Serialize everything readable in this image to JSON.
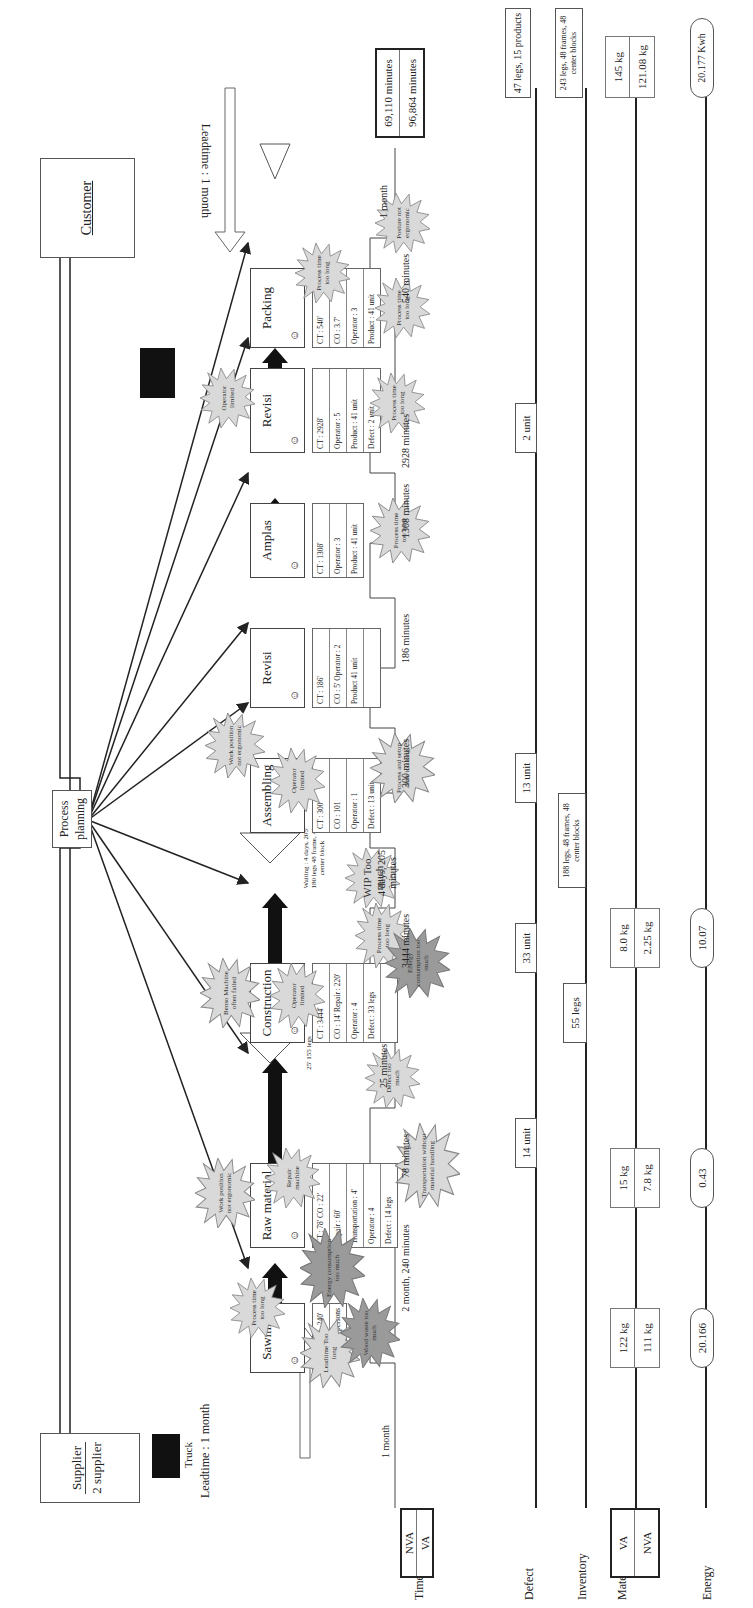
{
  "entities": {
    "supplier": {
      "title": "Supplier",
      "subtitle": "2 supplier"
    },
    "customer": {
      "title": "Customer"
    },
    "process_planning": {
      "label_line1": "Process",
      "label_line2": "planning"
    },
    "supplier_truck": {
      "label": "Truck",
      "leadtime": "Leadtime : 1 month"
    },
    "customer_leadtime": "Leadtime : 1 month"
  },
  "processes": [
    {
      "name": "Sawmill",
      "data": [
        "CT : 2 month, 240'",
        "Operator : 4 persons"
      ]
    },
    {
      "name": "Raw material",
      "data": [
        "CT : 78'  CO : 22'",
        "Repair : 60'",
        "Transportation : 4'",
        "Operator : 4",
        "Defect : 14 legs"
      ]
    },
    {
      "name": "Construction",
      "data": [
        "CT : 3444'",
        "CO : 14'  Repair : 220'",
        "Operator : 4",
        "Defect : 33 legs",
        ""
      ]
    },
    {
      "name": "Assembling",
      "data": [
        "CT : 300",
        "CO : 101",
        "Operator : 1",
        "Defect : 13 unit"
      ]
    },
    {
      "name": "Revisi",
      "data": [
        "CT : 186'",
        "CO : 5'  Operator : 2",
        "Product 41 unit",
        ""
      ]
    },
    {
      "name": "Amplas",
      "data": [
        "CT : 1308'",
        "Operator : 3",
        "Product : 41 unit"
      ]
    },
    {
      "name": "Revisi",
      "data": [
        "CT : 2928'",
        "Operator : 5",
        "Product : 41 unit",
        "Defect : 2 unit"
      ]
    },
    {
      "name": "Packing",
      "data": [
        "CT : 540'",
        "CO : 3.7'",
        "Operator : 3",
        "Product : 41 unit"
      ]
    }
  ],
  "inventory_triangles": [
    {
      "id": "raw-wip",
      "note": "25'  155 legs"
    },
    {
      "id": "construction-wip",
      "note": "Waiting : 4 days, 205'  180 legs  48 frame,  48 center block"
    }
  ],
  "kaizen_bursts": [
    {
      "text": "Leadtime Too long",
      "tone": "light"
    },
    {
      "text": "Process time too long",
      "tone": "light"
    },
    {
      "text": "Energy consumption too much",
      "tone": "dark"
    },
    {
      "text": "Wood waste too much",
      "tone": "dark"
    },
    {
      "text": "Work position not ergonomic",
      "tone": "light"
    },
    {
      "text": "Repair machine",
      "tone": "light"
    },
    {
      "text": "Transportation without material handling",
      "tone": "light"
    },
    {
      "text": "Defect too much",
      "tone": "light"
    },
    {
      "text": "Benso Machine often failed",
      "tone": "light"
    },
    {
      "text": "Operator limited",
      "tone": "light"
    },
    {
      "text": "Process time too long",
      "tone": "light"
    },
    {
      "text": "Energy consumption too much",
      "tone": "dark"
    },
    {
      "text": "WIP Too much",
      "tone": "light"
    },
    {
      "text": "Operator limited",
      "tone": "light"
    },
    {
      "text": "Work position not ergonomic",
      "tone": "light"
    },
    {
      "text": "Process and setup time too long",
      "tone": "light"
    },
    {
      "text": "Process time too long",
      "tone": "light"
    },
    {
      "text": "Operator limited",
      "tone": "light"
    },
    {
      "text": "Process time too long",
      "tone": "light"
    },
    {
      "text": "Process time too long",
      "tone": "light"
    },
    {
      "text": "Process time too long",
      "tone": "light"
    },
    {
      "text": "Posture not ergonomic",
      "tone": "light"
    }
  ],
  "timeline": {
    "row_labels": {
      "time": "Time",
      "defect": "Defect",
      "inventory": "Inventory",
      "material": "Material",
      "energy": "Energy"
    },
    "legend_time": {
      "top": "NVA",
      "bottom": "VA"
    },
    "legend_material": {
      "top": "VA",
      "bottom": "NVA"
    },
    "time_segments": [
      "1 month",
      "2 month, 240 minutes",
      "78 minutes",
      "25 minutes",
      "3444 minutes",
      "4 days, 205 minutes",
      "300 minutes",
      "186 minutes",
      "1308 minutes",
      "2928 minutes",
      "540 minutes",
      "1 month"
    ],
    "time_totals": {
      "nva": "69,110 minutes",
      "va": "96,864 minutes"
    },
    "defects": [
      "14 unit",
      "33 unit",
      "13 unit",
      "2 unit"
    ],
    "defect_total": "47 legs, 15 products",
    "inventory": [
      "55 legs",
      "188 legs, 48 frames, 48 center blocks"
    ],
    "inventory_total": "243 legs, 48 frames, 48 center blocks",
    "material": [
      {
        "va": "122 kg",
        "nva": "111 kg"
      },
      {
        "va": "15 kg",
        "nva": "7.8 kg"
      },
      {
        "va": "8.0 kg",
        "nva": "2.25 kg"
      }
    ],
    "material_total": {
      "va": "145 kg",
      "nva": "121.08 kg"
    },
    "energy": [
      "20.166",
      "0.43",
      "10.07"
    ],
    "energy_total": "20.177 Kwh"
  },
  "colors": {
    "burst_light": "#d9d9d9",
    "burst_dark": "#9a9a9a",
    "line": "#222222"
  }
}
